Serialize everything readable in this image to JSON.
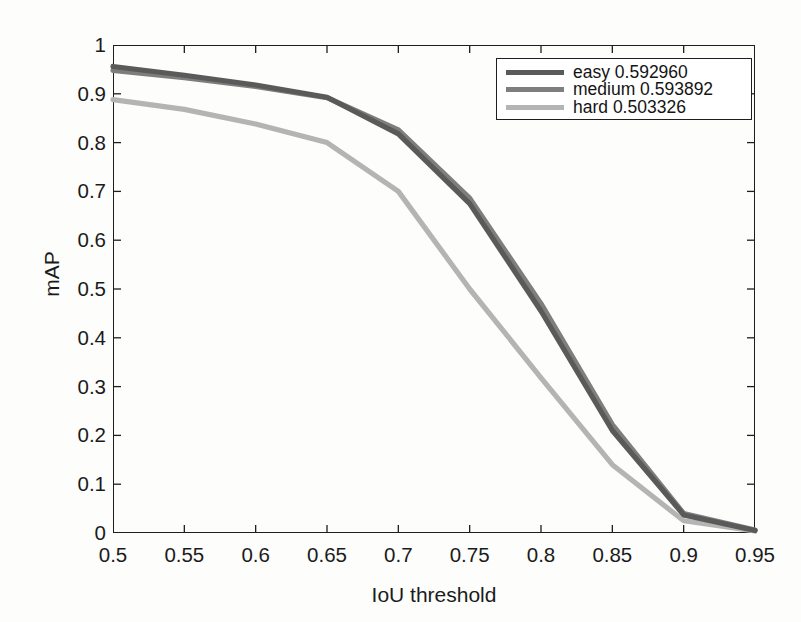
{
  "figure": {
    "background_color": "#fdfdfb",
    "axis_color": "#1e1e1e"
  },
  "legend": {
    "position": "upper-right",
    "entries": [
      {
        "label": "easy 0.592960",
        "color": "#5a5a5a"
      },
      {
        "label": "medium 0.593892",
        "color": "#7e7e7e"
      },
      {
        "label": "hard 0.503326",
        "color": "#b4b4b4"
      }
    ]
  },
  "axes": {
    "x": {
      "label": "IoU threshold",
      "ticks": [
        "0.5",
        "0.55",
        "0.6",
        "0.65",
        "0.7",
        "0.75",
        "0.8",
        "0.85",
        "0.9",
        "0.95"
      ],
      "min": 0.5,
      "max": 0.95
    },
    "y": {
      "label": "mAP",
      "ticks": [
        "1",
        "0.9",
        "0.8",
        "0.7",
        "0.6",
        "0.5",
        "0.4",
        "0.3",
        "0.2",
        "0.1",
        "0"
      ],
      "min": 0,
      "max": 1
    }
  },
  "chart_data": {
    "type": "line",
    "title": "",
    "xlabel": "IoU threshold",
    "ylabel": "mAP",
    "xlim": [
      0.5,
      0.95
    ],
    "ylim": [
      0,
      1
    ],
    "grid": false,
    "legend_position": "upper right",
    "x": [
      0.5,
      0.55,
      0.6,
      0.65,
      0.7,
      0.75,
      0.8,
      0.85,
      0.9,
      0.95
    ],
    "series": [
      {
        "name": "easy 0.592960",
        "color": "#5a5a5a",
        "values": [
          0.956,
          0.938,
          0.918,
          0.893,
          0.818,
          0.675,
          0.455,
          0.21,
          0.037,
          0.005
        ]
      },
      {
        "name": "medium 0.593892",
        "color": "#7e7e7e",
        "values": [
          0.948,
          0.933,
          0.915,
          0.892,
          0.826,
          0.686,
          0.47,
          0.222,
          0.04,
          0.006
        ]
      },
      {
        "name": "hard 0.503326",
        "color": "#b4b4b4",
        "values": [
          0.888,
          0.868,
          0.838,
          0.8,
          0.7,
          0.5,
          0.318,
          0.14,
          0.025,
          0.004
        ]
      }
    ]
  }
}
